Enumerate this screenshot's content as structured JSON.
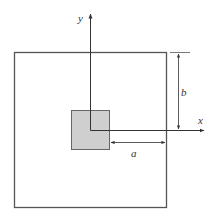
{
  "diagram": {
    "type": "cross-section with centroid axes",
    "labels": {
      "y_axis": "y",
      "x_axis": "x",
      "dim_a": "a",
      "dim_b": "b"
    },
    "colors": {
      "line": "#444444",
      "shaded_fill": "#cfcfcf",
      "background": "#ffffff"
    },
    "shapes": {
      "outer_square": {
        "x": 14,
        "y": 52,
        "w": 152,
        "h": 155
      },
      "inner_square": {
        "x": 71,
        "y": 110,
        "w": 38,
        "h": 39
      },
      "origin": {
        "x": 90,
        "y": 130
      }
    }
  }
}
